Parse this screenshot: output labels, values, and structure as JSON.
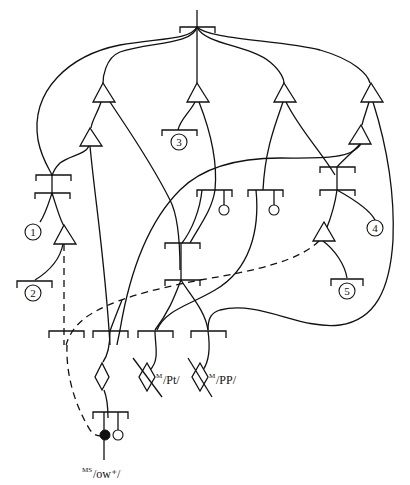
{
  "diagram": {
    "numbered_nodes": [
      {
        "id": "node-1",
        "label": "1"
      },
      {
        "id": "node-2",
        "label": "2"
      },
      {
        "id": "node-3",
        "label": "3"
      },
      {
        "id": "node-4",
        "label": "4"
      },
      {
        "id": "node-5",
        "label": "5"
      }
    ],
    "phonetic_labels": [
      {
        "id": "label-pt",
        "superscript": "M",
        "text": "/Pt/"
      },
      {
        "id": "label-pp",
        "superscript": "M",
        "text": "/PP/"
      },
      {
        "id": "label-ow",
        "superscript": "MS",
        "text": "/ow⁺/"
      }
    ]
  }
}
